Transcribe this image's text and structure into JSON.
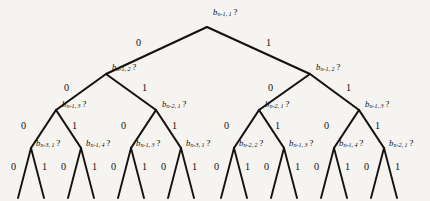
{
  "figure": {
    "name": "binary-decision-tree",
    "background_color": "#f6f4f1",
    "stroke_color": "#15120f",
    "width": 430,
    "height": 201
  },
  "nodes": [
    {
      "id": "root",
      "var": "b",
      "sub": "n-1, 1",
      "q": "?",
      "x": 207,
      "y": 27,
      "label_x": 213,
      "label_y": 8
    },
    {
      "id": "n2l",
      "var": "b",
      "sub": "n-1, 2",
      "q": "?",
      "x": 106,
      "y": 74,
      "label_x": 112,
      "label_y": 63
    },
    {
      "id": "n2r",
      "var": "b",
      "sub": "n-1, 2",
      "q": "?",
      "x": 310,
      "y": 74,
      "label_x": 316,
      "label_y": 63
    },
    {
      "id": "n3a",
      "var": "b",
      "sub": "n-1, 3",
      "q": "?",
      "x": 56,
      "y": 110,
      "label_x": 62,
      "label_y": 100
    },
    {
      "id": "n3b",
      "var": "b",
      "sub": "n-2, 1",
      "q": "?",
      "x": 156,
      "y": 110,
      "label_x": 162,
      "label_y": 100
    },
    {
      "id": "n3c",
      "var": "b",
      "sub": "n-2, 1",
      "q": "?",
      "x": 259,
      "y": 110,
      "label_x": 265,
      "label_y": 100
    },
    {
      "id": "n3d",
      "var": "b",
      "sub": "n-1, 3",
      "q": "?",
      "x": 359,
      "y": 110,
      "label_x": 365,
      "label_y": 100
    },
    {
      "id": "n4a",
      "var": "b",
      "sub": "n-3, 1",
      "q": "?",
      "x": 31,
      "y": 148,
      "label_x": 36,
      "label_y": 139
    },
    {
      "id": "n4b",
      "var": "b",
      "sub": "n-1, 4",
      "q": "?",
      "x": 81,
      "y": 148,
      "label_x": 86,
      "label_y": 139
    },
    {
      "id": "n4c",
      "var": "b",
      "sub": "n-1, 3",
      "q": "?",
      "x": 131,
      "y": 148,
      "label_x": 136,
      "label_y": 139
    },
    {
      "id": "n4d",
      "var": "b",
      "sub": "n-3, 1",
      "q": "?",
      "x": 181,
      "y": 148,
      "label_x": 186,
      "label_y": 139
    },
    {
      "id": "n4e",
      "var": "b",
      "sub": "n-2, 2",
      "q": "?",
      "x": 234,
      "y": 148,
      "label_x": 239,
      "label_y": 139
    },
    {
      "id": "n4f",
      "var": "b",
      "sub": "n-1, 3",
      "q": "?",
      "x": 284,
      "y": 148,
      "label_x": 289,
      "label_y": 139
    },
    {
      "id": "n4g",
      "var": "b",
      "sub": "n-1, 4",
      "q": "?",
      "x": 334,
      "y": 148,
      "label_x": 339,
      "label_y": 139
    },
    {
      "id": "n4h",
      "var": "b",
      "sub": "n-2, 1",
      "q": "?",
      "x": 384,
      "y": 148,
      "label_x": 389,
      "label_y": 139
    }
  ],
  "edges": [
    {
      "x1": 207,
      "y1": 27,
      "x2": 106,
      "y2": 74
    },
    {
      "x1": 207,
      "y1": 27,
      "x2": 310,
      "y2": 74
    },
    {
      "x1": 106,
      "y1": 74,
      "x2": 56,
      "y2": 110
    },
    {
      "x1": 106,
      "y1": 74,
      "x2": 156,
      "y2": 110
    },
    {
      "x1": 310,
      "y1": 74,
      "x2": 259,
      "y2": 110
    },
    {
      "x1": 310,
      "y1": 74,
      "x2": 359,
      "y2": 110
    },
    {
      "x1": 56,
      "y1": 110,
      "x2": 31,
      "y2": 148
    },
    {
      "x1": 56,
      "y1": 110,
      "x2": 81,
      "y2": 148
    },
    {
      "x1": 156,
      "y1": 110,
      "x2": 131,
      "y2": 148
    },
    {
      "x1": 156,
      "y1": 110,
      "x2": 181,
      "y2": 148
    },
    {
      "x1": 259,
      "y1": 110,
      "x2": 234,
      "y2": 148
    },
    {
      "x1": 259,
      "y1": 110,
      "x2": 284,
      "y2": 148
    },
    {
      "x1": 359,
      "y1": 110,
      "x2": 334,
      "y2": 148
    },
    {
      "x1": 359,
      "y1": 110,
      "x2": 384,
      "y2": 148
    },
    {
      "x1": 31,
      "y1": 148,
      "x2": 18,
      "y2": 198
    },
    {
      "x1": 31,
      "y1": 148,
      "x2": 44,
      "y2": 198
    },
    {
      "x1": 81,
      "y1": 148,
      "x2": 68,
      "y2": 198
    },
    {
      "x1": 81,
      "y1": 148,
      "x2": 94,
      "y2": 198
    },
    {
      "x1": 131,
      "y1": 148,
      "x2": 118,
      "y2": 198
    },
    {
      "x1": 131,
      "y1": 148,
      "x2": 144,
      "y2": 198
    },
    {
      "x1": 181,
      "y1": 148,
      "x2": 168,
      "y2": 198
    },
    {
      "x1": 181,
      "y1": 148,
      "x2": 194,
      "y2": 198
    },
    {
      "x1": 234,
      "y1": 148,
      "x2": 221,
      "y2": 198
    },
    {
      "x1": 234,
      "y1": 148,
      "x2": 247,
      "y2": 198
    },
    {
      "x1": 284,
      "y1": 148,
      "x2": 271,
      "y2": 198
    },
    {
      "x1": 284,
      "y1": 148,
      "x2": 297,
      "y2": 198
    },
    {
      "x1": 334,
      "y1": 148,
      "x2": 321,
      "y2": 198
    },
    {
      "x1": 334,
      "y1": 148,
      "x2": 347,
      "y2": 198
    },
    {
      "x1": 384,
      "y1": 148,
      "x2": 371,
      "y2": 198
    },
    {
      "x1": 384,
      "y1": 148,
      "x2": 397,
      "y2": 198
    }
  ],
  "edge_labels": [
    {
      "text": "0",
      "x": 136,
      "y": 38
    },
    {
      "text": "1",
      "x": 266,
      "y": 38
    },
    {
      "text": "0",
      "x": 64,
      "y": 83
    },
    {
      "text": "1",
      "x": 142,
      "y": 83
    },
    {
      "text": "0",
      "x": 268,
      "y": 83
    },
    {
      "text": "1",
      "x": 346,
      "y": 83
    },
    {
      "text": "0",
      "x": 21,
      "y": 121
    },
    {
      "text": "1",
      "x": 72,
      "y": 121
    },
    {
      "text": "0",
      "x": 121,
      "y": 121
    },
    {
      "text": "1",
      "x": 172,
      "y": 121
    },
    {
      "text": "0",
      "x": 224,
      "y": 121
    },
    {
      "text": "1",
      "x": 275,
      "y": 121
    },
    {
      "text": "0",
      "x": 324,
      "y": 121
    },
    {
      "text": "1",
      "x": 375,
      "y": 121
    },
    {
      "text": "0",
      "x": 11,
      "y": 162
    },
    {
      "text": "1",
      "x": 42,
      "y": 162
    },
    {
      "text": "0",
      "x": 61,
      "y": 162
    },
    {
      "text": "1",
      "x": 92,
      "y": 162
    },
    {
      "text": "0",
      "x": 111,
      "y": 162
    },
    {
      "text": "1",
      "x": 142,
      "y": 162
    },
    {
      "text": "0",
      "x": 161,
      "y": 162
    },
    {
      "text": "1",
      "x": 192,
      "y": 162
    },
    {
      "text": "0",
      "x": 214,
      "y": 162
    },
    {
      "text": "1",
      "x": 245,
      "y": 162
    },
    {
      "text": "0",
      "x": 264,
      "y": 162
    },
    {
      "text": "1",
      "x": 295,
      "y": 162
    },
    {
      "text": "0",
      "x": 314,
      "y": 162
    },
    {
      "text": "1",
      "x": 345,
      "y": 162
    },
    {
      "text": "0",
      "x": 364,
      "y": 162
    },
    {
      "text": "1",
      "x": 395,
      "y": 162
    }
  ]
}
